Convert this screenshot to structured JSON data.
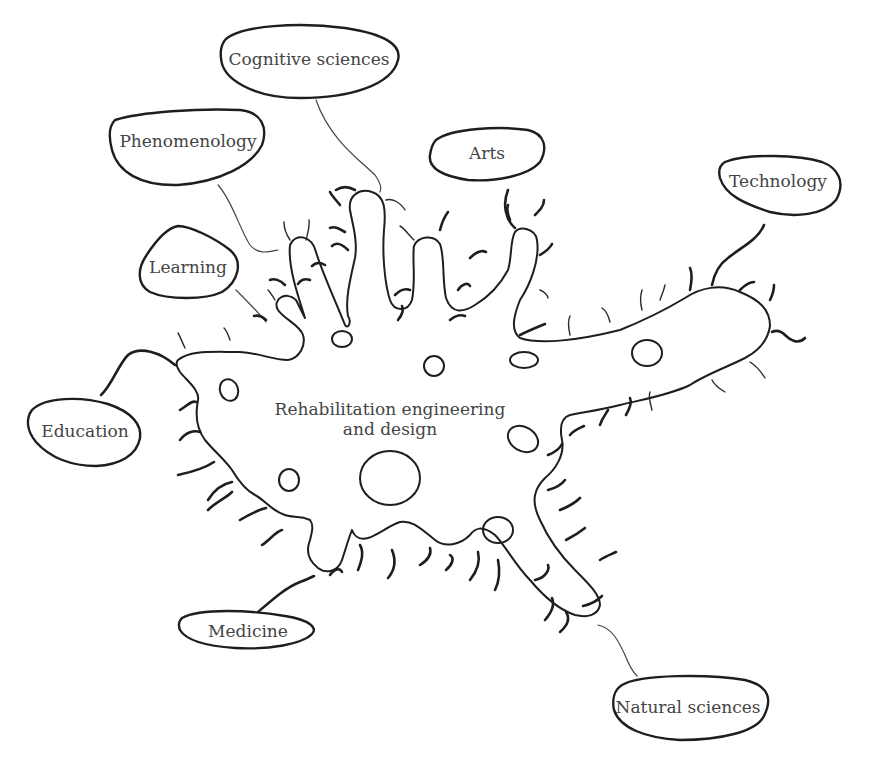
{
  "diagram": {
    "center": {
      "line1": "Rehabilitation engineering",
      "line2": "and design"
    },
    "nodes": [
      {
        "id": "cognitive-sciences",
        "label": "Cognitive sciences"
      },
      {
        "id": "phenomenology",
        "label": "Phenomenology"
      },
      {
        "id": "arts",
        "label": "Arts"
      },
      {
        "id": "technology",
        "label": "Technology"
      },
      {
        "id": "learning",
        "label": "Learning"
      },
      {
        "id": "education",
        "label": "Education"
      },
      {
        "id": "medicine",
        "label": "Medicine"
      },
      {
        "id": "natural-sciences",
        "label": "Natural sciences"
      }
    ],
    "colors": {
      "stroke": "#1e1e1e",
      "text": "#444444",
      "background": "#ffffff"
    }
  }
}
